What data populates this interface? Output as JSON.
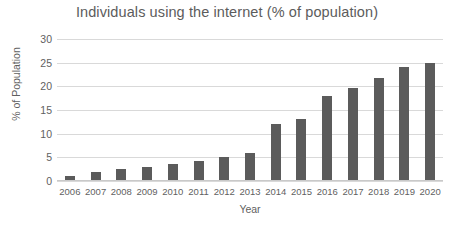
{
  "chart_data": {
    "type": "bar",
    "title": "Individuals using the internet (% of population)",
    "xlabel": "Year",
    "ylabel": "% of Population",
    "categories": [
      "2006",
      "2007",
      "2008",
      "2009",
      "2010",
      "2011",
      "2012",
      "2013",
      "2014",
      "2015",
      "2016",
      "2017",
      "2018",
      "2019",
      "2020"
    ],
    "values": [
      1,
      2,
      2.5,
      3,
      3.5,
      4.2,
      5,
      6,
      12,
      13,
      18,
      19.7,
      21.7,
      24,
      25
    ],
    "ylim": [
      0,
      30
    ],
    "yticks": [
      0,
      5,
      10,
      15,
      20,
      25,
      30
    ],
    "ytick_labels": [
      "0",
      "5",
      "10",
      "15",
      "20",
      "25",
      "30"
    ],
    "grid": true,
    "legend": false,
    "legend_position": "none",
    "bar_color": "#5b5b5b",
    "grid_color": "#d9d9d9",
    "text_color": "#5f5f5f"
  }
}
